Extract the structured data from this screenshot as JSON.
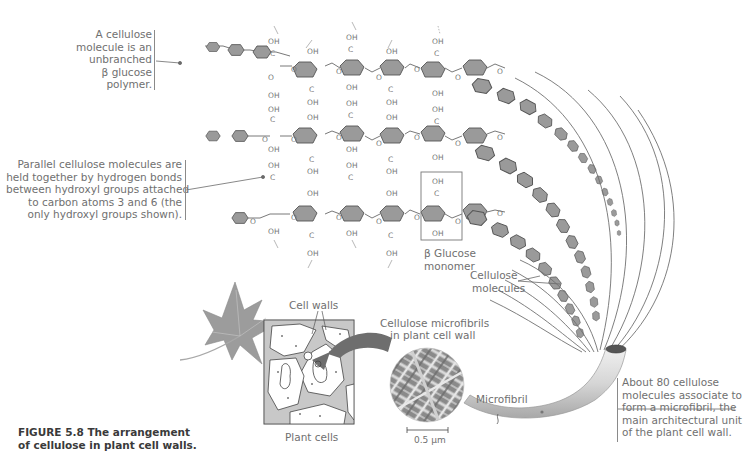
{
  "figure": {
    "caption_lines": [
      "FIGURE 5.8  The arrangement",
      "of cellulose in plant cell walls."
    ]
  },
  "callouts": {
    "polymer": {
      "lines": [
        "A cellulose",
        "molecule is an",
        "unbranched",
        "β glucose",
        "polymer."
      ]
    },
    "hydrogen_bonds": {
      "lines": [
        "Parallel cellulose molecules are",
        "held together by hydrogen bonds",
        "between hydroxyl groups attached",
        "to carbon atoms 3 and 6 (the",
        "only hydroxyl groups shown)."
      ]
    },
    "microfibril_note": {
      "lines": [
        "About 80 cellulose",
        "molecules associate to",
        "form a microfibril, the",
        "main architectural unit",
        "of the plant cell wall."
      ]
    }
  },
  "labels": {
    "glucose_monomer": [
      "β Glucose",
      "monomer"
    ],
    "cellulose_molecules": [
      "Cellulose",
      "molecules"
    ],
    "cell_walls": "Cell walls",
    "microfibrils_in_wall": [
      "Cellulose microfibrils",
      "in plant cell wall"
    ],
    "microfibril": "Microfibril",
    "scale_bar": "0.5 µm",
    "plant_cells": "Plant cells"
  },
  "chemistry": {
    "hydroxyl": "OH",
    "carbon": "C",
    "oxygen": "O"
  },
  "colors": {
    "ring_fill": "#9a9a9a",
    "ring_stroke": "#555555",
    "text": "#707070",
    "caption": "#3a3a3a",
    "arrow": "#6e6e6e"
  }
}
